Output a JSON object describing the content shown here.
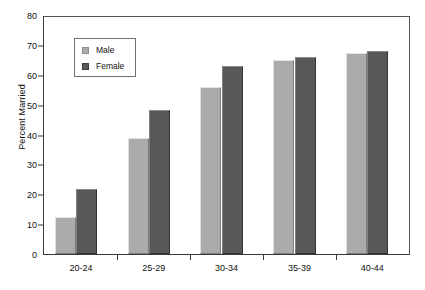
{
  "chart_data": {
    "type": "bar",
    "title": "",
    "xlabel": "",
    "ylabel": "Percent Married",
    "categories": [
      "20-24",
      "25-29",
      "30-34",
      "35-39",
      "40-44"
    ],
    "series": [
      {
        "name": "Male",
        "color": "#ababab",
        "values": [
          12.5,
          39.0,
          56.0,
          65.0,
          67.5
        ]
      },
      {
        "name": "Female",
        "color": "#585858",
        "values": [
          22.0,
          48.5,
          63.0,
          66.0,
          68.0
        ]
      }
    ],
    "ylim": [
      0,
      80
    ],
    "yticks": [
      0,
      10,
      20,
      30,
      40,
      50,
      60,
      70,
      80
    ],
    "ytick_labels": [
      "0",
      "10",
      "20",
      "30",
      "40",
      "50",
      "60",
      "70",
      "80"
    ],
    "grid": false,
    "legend_position": "upper-left-inside",
    "legend_entries": [
      "Male",
      "Female"
    ]
  }
}
